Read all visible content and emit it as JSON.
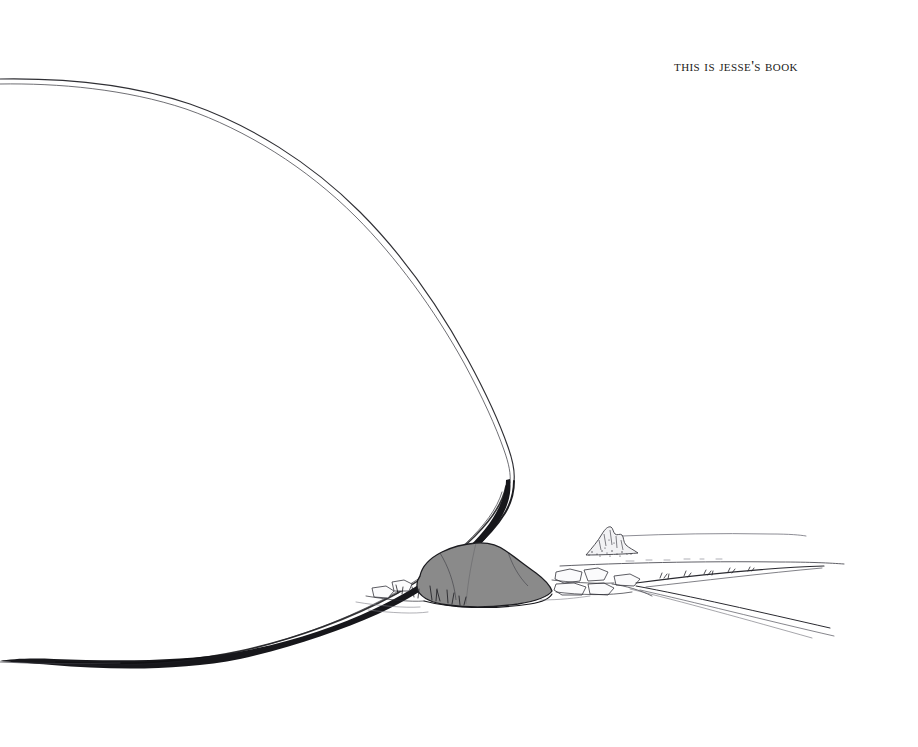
{
  "page": {
    "width": 918,
    "height": 747,
    "background_color": "#ffffff",
    "medium": "pen-and-ink illustration",
    "title": "This is Jesse's book"
  },
  "inscription": {
    "text": "This is Jesse's book",
    "style": "small-caps serif",
    "color": "#1b1b20",
    "position": "upper-right"
  },
  "artwork": {
    "name": "desert-landscape-drawing",
    "description": "Sparse pen-and-ink desert scene: a large sweeping tapered dark form curves from the upper-left edge down to a gray boulder on the ground, with a low horizon, a small stippled rocky butte at right, and converging trail lines receding to the right.",
    "ink_color": "#16161a",
    "line_color": "#2a2a2e",
    "boulder_fill": "#8a8a8a",
    "boulder_stroke": "#1d1d21",
    "faint_line_color": "#6d6d74",
    "elements": [
      {
        "name": "sweeping-curve",
        "label": "Large tapered sweep"
      },
      {
        "name": "boulder",
        "label": "Gray boulder"
      },
      {
        "name": "horizon-line",
        "label": "Distant horizon"
      },
      {
        "name": "rocky-butte",
        "label": "Small rocky outcrop"
      },
      {
        "name": "foreground-rocks",
        "label": "Scattered foreground rocks"
      },
      {
        "name": "trail-lines",
        "label": "Converging trail lines"
      },
      {
        "name": "ground-line",
        "label": "Descending ground stroke"
      }
    ]
  }
}
